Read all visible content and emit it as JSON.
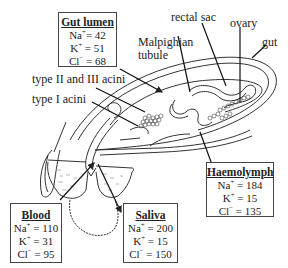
{
  "labels": {
    "rectal_sac": "rectal sac",
    "ovary": "ovary",
    "gut": "gut",
    "malpighian_line1": "Malpighian",
    "malpighian_line2": "tubule",
    "type_23_acini": "type II and III acini",
    "type_1_acini": "type I acini"
  },
  "boxes": {
    "gut_lumen": {
      "title": "Gut lumen",
      "rows": [
        {
          "ion": "Na",
          "charge": "+",
          "value": "= 42"
        },
        {
          "ion": "K",
          "charge": "+",
          "value": " = 51"
        },
        {
          "ion": "Cl",
          "charge": "−",
          "value": " = 68"
        }
      ]
    },
    "haemolymph": {
      "title": "Haemolymph",
      "rows": [
        {
          "ion": "Na",
          "charge": "+",
          "value": " = 184"
        },
        {
          "ion": "K",
          "charge": "+",
          "value": "  = 15"
        },
        {
          "ion": "Cl",
          "charge": "−",
          "value": " = 135"
        }
      ]
    },
    "blood": {
      "title": "Blood",
      "rows": [
        {
          "ion": "Na",
          "charge": "+",
          "value": " = 110"
        },
        {
          "ion": "K",
          "charge": "+",
          "value": " = 31"
        },
        {
          "ion": "Cl",
          "charge": "−",
          "value": " = 95"
        }
      ]
    },
    "saliva": {
      "title": "Saliva",
      "rows": [
        {
          "ion": "Na",
          "charge": "+",
          "value": " = 200"
        },
        {
          "ion": "K",
          "charge": "+",
          "value": " = 15"
        },
        {
          "ion": "Cl",
          "charge": "−",
          "value": " = 150"
        }
      ]
    }
  }
}
